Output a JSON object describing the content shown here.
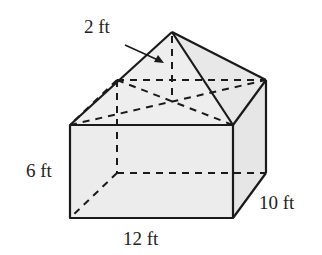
{
  "figure": {
    "type": "composite solid: rectangular prism with square pyramid on top",
    "labels": {
      "pyramid_height": "2 ft",
      "prism_height": "6 ft",
      "prism_length": "12 ft",
      "prism_width": "10 ft"
    },
    "colors": {
      "fill": "#ececec",
      "stroke": "#1a1a1a"
    }
  }
}
